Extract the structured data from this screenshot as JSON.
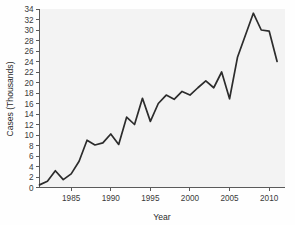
{
  "chart_data": {
    "type": "line",
    "title": "",
    "xlabel": "Year",
    "ylabel": "Cases (Thousands)",
    "xlim": [
      1981,
      2012
    ],
    "ylim": [
      0,
      34
    ],
    "grid": false,
    "legend": null,
    "xticks": [
      1985,
      1990,
      1995,
      2000,
      2005,
      2010
    ],
    "xticklabels": [
      "1985",
      "1990",
      "1995",
      "2000",
      "2005",
      "2010"
    ],
    "yticks": [
      0,
      2,
      4,
      6,
      8,
      10,
      12,
      14,
      16,
      18,
      20,
      22,
      24,
      26,
      28,
      30,
      32,
      34
    ],
    "yticklabels": [
      "0",
      "2",
      "4",
      "6",
      "8",
      "10",
      "12",
      "14",
      "16",
      "18",
      "20",
      "22",
      "24",
      "26",
      "28",
      "30",
      "32",
      "34"
    ],
    "series": [
      {
        "name": "Cases (Thousands)",
        "x": [
          1981,
          1982,
          1983,
          1984,
          1985,
          1986,
          1987,
          1988,
          1989,
          1990,
          1991,
          1992,
          1993,
          1994,
          1995,
          1996,
          1997,
          1998,
          1999,
          2000,
          2001,
          2002,
          2003,
          2004,
          2005,
          2006,
          2007,
          2008,
          2009,
          2010,
          2011
        ],
        "values": [
          0.5,
          1.2,
          3.2,
          1.5,
          2.6,
          5.0,
          9.0,
          8.1,
          8.5,
          10.2,
          8.2,
          13.4,
          12.0,
          17.0,
          12.6,
          16.0,
          17.6,
          16.8,
          18.3,
          17.6,
          19.0,
          20.3,
          19.0,
          22.0,
          16.9,
          24.8,
          29.0,
          33.2,
          30.0,
          29.8,
          24.0
        ]
      }
    ]
  },
  "chart_style": {
    "line_color": "#2c2c2c",
    "axis_color": "#5a5a5a",
    "text_color": "#3a3a3a",
    "plot_background": "#f3f3f3",
    "figure_background": "#fefefe"
  }
}
